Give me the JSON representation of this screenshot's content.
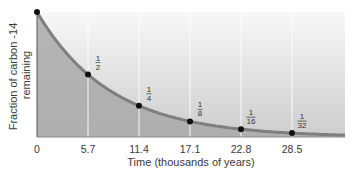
{
  "chart_data": {
    "type": "line",
    "title": "",
    "xlabel": "Time (thousands of years)",
    "ylabel": "Fraction of carbon -14 remaining",
    "ylabel_lines": [
      "Fraction of carbon -14",
      "remaining"
    ],
    "x_ticks": [
      "0",
      "5.7",
      "11.4",
      "17.1",
      "22.8",
      "28.5"
    ],
    "x": [
      0,
      5.7,
      11.4,
      17.1,
      22.8,
      28.5
    ],
    "values": [
      1,
      0.5,
      0.25,
      0.125,
      0.0625,
      0.03125
    ],
    "point_labels": [
      {
        "num": "",
        "den": ""
      },
      {
        "num": "1",
        "den": "2"
      },
      {
        "num": "1",
        "den": "4"
      },
      {
        "num": "1",
        "den": "8"
      },
      {
        "num": "1",
        "den": "16"
      },
      {
        "num": "1",
        "den": "32"
      }
    ],
    "xlim": [
      0,
      34
    ],
    "ylim": [
      0,
      1
    ],
    "grid": "vertical lines at data x positions",
    "legend": null,
    "area_fill": true,
    "colors": {
      "curve": "#7f7f7f",
      "area": "#a9a9a9",
      "background_top": "#f7f7f7",
      "background_bottom": "#cfcfcf",
      "points": "#111111",
      "gridline": "#ffffff"
    }
  }
}
